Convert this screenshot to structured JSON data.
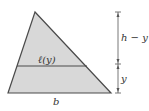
{
  "diagram": {
    "labels": {
      "top_segment": "h − y",
      "bottom_segment": "y",
      "cross_section": "ℓ(y)",
      "base": "b"
    },
    "colors": {
      "fill": "#d8d8d8",
      "stroke": "#4a4a4a",
      "dimension": "#555555"
    }
  }
}
